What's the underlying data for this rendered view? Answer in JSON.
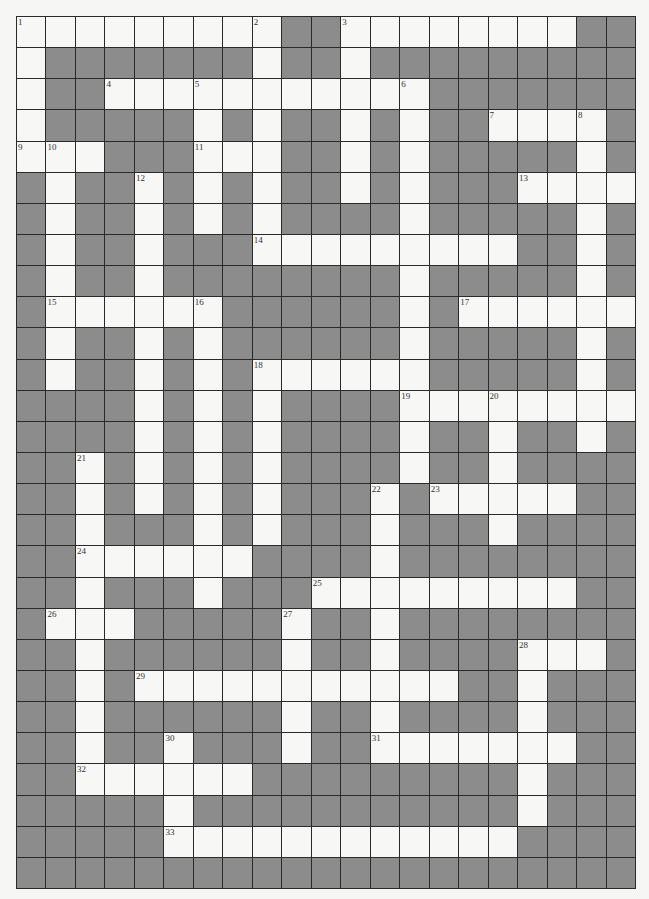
{
  "puzzle": {
    "type": "crossword",
    "rows": 28,
    "cols": 21,
    "colors": {
      "block": "#8c8c8c",
      "open": "#f7f7f5",
      "line": "#2a2a2a"
    },
    "grid": [
      ".........##........##",
      ".#######.##.#########",
      ".##...........#######",
      ".#####.#.##.#.##....#",
      "...###...##.#.#####.#",
      "#.##.#.#.##.#.###....",
      "#.##.#.#.####.#####.#",
      "#.##.###.........##.#",
      "#.##.########.#####.#",
      "#......######.#......",
      "#.##.#.######.#####.#",
      "#.##.#.#......#####.#",
      "####.#.#.####........",
      "####.#.#.####.##.##.#",
      "##.#.#.#.####.##.####",
      "##.#.#.#.###.#.....##",
      "##.###.#.###.###.####",
      "##......####.########",
      "##.###.###.........##",
      "#...#####.##.########",
      "##.######.##.####...#",
      "##.#...........##.###",
      "##.######.##.####.###",
      "##.##.###.##.......##",
      "##......#########.###",
      "#####.###########.###",
      "#####............####",
      "#####################"
    ],
    "numbers": [
      {
        "n": "1",
        "r": 0,
        "c": 0
      },
      {
        "n": "2",
        "r": 0,
        "c": 8
      },
      {
        "n": "3",
        "r": 0,
        "c": 11
      },
      {
        "n": "4",
        "r": 2,
        "c": 3
      },
      {
        "n": "5",
        "r": 2,
        "c": 6
      },
      {
        "n": "6",
        "r": 2,
        "c": 13
      },
      {
        "n": "7",
        "r": 3,
        "c": 16
      },
      {
        "n": "8",
        "r": 3,
        "c": 19
      },
      {
        "n": "9",
        "r": 4,
        "c": 0
      },
      {
        "n": "10",
        "r": 4,
        "c": 1
      },
      {
        "n": "11",
        "r": 4,
        "c": 6
      },
      {
        "n": "12",
        "r": 5,
        "c": 4
      },
      {
        "n": "13",
        "r": 5,
        "c": 17
      },
      {
        "n": "14",
        "r": 7,
        "c": 8
      },
      {
        "n": "15",
        "r": 9,
        "c": 1
      },
      {
        "n": "16",
        "r": 9,
        "c": 6
      },
      {
        "n": "17",
        "r": 9,
        "c": 15
      },
      {
        "n": "18",
        "r": 11,
        "c": 8
      },
      {
        "n": "19",
        "r": 12,
        "c": 13
      },
      {
        "n": "20",
        "r": 12,
        "c": 16
      },
      {
        "n": "21",
        "r": 14,
        "c": 2
      },
      {
        "n": "22",
        "r": 15,
        "c": 12
      },
      {
        "n": "23",
        "r": 15,
        "c": 14
      },
      {
        "n": "24",
        "r": 17,
        "c": 2
      },
      {
        "n": "25",
        "r": 18,
        "c": 10
      },
      {
        "n": "26",
        "r": 19,
        "c": 1
      },
      {
        "n": "27",
        "r": 19,
        "c": 9
      },
      {
        "n": "28",
        "r": 20,
        "c": 17
      },
      {
        "n": "29",
        "r": 21,
        "c": 4
      },
      {
        "n": "30",
        "r": 23,
        "c": 5
      },
      {
        "n": "31",
        "r": 23,
        "c": 12
      },
      {
        "n": "32",
        "r": 24,
        "c": 2
      },
      {
        "n": "33",
        "r": 26,
        "c": 5
      }
    ]
  }
}
